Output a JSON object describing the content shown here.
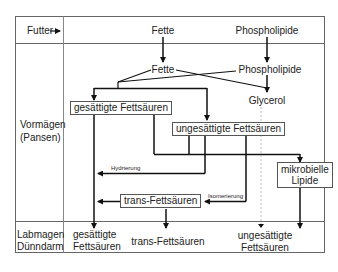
{
  "rows": {
    "futter": "Futter",
    "vormagen_1": "Vormägen",
    "vormagen_2": "(Pansen)",
    "labmagen_1": "Labmagen",
    "labmagen_2": "Dünndarm"
  },
  "top": {
    "fette": "Fette",
    "phospholipide": "Phospholipide"
  },
  "rumen": {
    "fette": "Fette",
    "phospholipide": "Phospholipide",
    "glycerol": "Glycerol",
    "saturated": "gesättigte Fettsäuren",
    "unsaturated": "ungesättigte Fettsäuren",
    "hydrierung": "Hydrierung",
    "isomerierung": "Isomerierung",
    "trans": "trans-Fettsäuren",
    "microbial_1": "mikrobielle",
    "microbial_2": "Lipide"
  },
  "bottom": {
    "saturated_1": "gesättigte",
    "saturated_2": "Fettsäuren",
    "trans": "trans-Fettsäuren",
    "unsaturated_1": "ungesättigte",
    "unsaturated_2": "Fettsäuren"
  }
}
